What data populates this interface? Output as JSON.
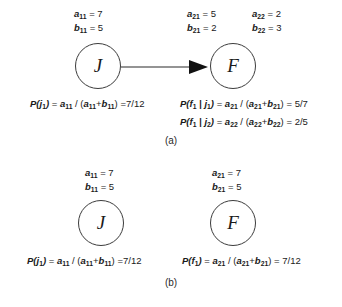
{
  "figure": {
    "background": "#ffffff",
    "stroke_color": "#3c3c3c",
    "text_color": "#1a1a1a"
  },
  "panels": [
    {
      "id": "a",
      "caption": "(a)",
      "has_edge": true,
      "edge": {
        "from": "J",
        "to": "F",
        "style": "solid-arrow"
      },
      "nodes": [
        {
          "id": "J",
          "label": "J",
          "params": [
            {
              "name": "a",
              "sub": "11",
              "eq": "=",
              "value": "7"
            },
            {
              "name": "b",
              "sub": "11",
              "eq": "=",
              "value": "5"
            }
          ]
        },
        {
          "id": "F",
          "label": "F",
          "params": [
            {
              "name": "a",
              "sub": "21",
              "eq": "=",
              "value": "5"
            },
            {
              "name": "b",
              "sub": "21",
              "eq": "=",
              "value": "2"
            },
            {
              "name": "a",
              "sub": "22",
              "eq": "=",
              "value": "2"
            },
            {
              "name": "b",
              "sub": "22",
              "eq": "=",
              "value": "3"
            }
          ]
        }
      ],
      "equations": [
        {
          "id": "pj1",
          "lhs_fn": "P",
          "lhs_arg": "j",
          "lhs_sub": "1",
          "numerator": "a",
          "numerator_sub": "11",
          "denom_left": "a",
          "denom_left_sub": "11",
          "denom_right": "b",
          "denom_right_sub": "11",
          "result": "7/12"
        },
        {
          "id": "pf1_j1",
          "lhs_fn": "P",
          "lhs_arg": "f",
          "lhs_sub": "1",
          "cond_arg": "j",
          "cond_sub": "1",
          "numerator": "a",
          "numerator_sub": "21",
          "denom_left": "a",
          "denom_left_sub": "21",
          "denom_right": "b",
          "denom_right_sub": "21",
          "result": "5/7"
        },
        {
          "id": "pf1_j2",
          "lhs_fn": "P",
          "lhs_arg": "f",
          "lhs_sub": "1",
          "cond_arg": "j",
          "cond_sub": "2",
          "numerator": "a",
          "numerator_sub": "22",
          "denom_left": "a",
          "denom_left_sub": "22",
          "denom_right": "b",
          "denom_right_sub": "22",
          "result": "2/5"
        }
      ]
    },
    {
      "id": "b",
      "caption": "(b)",
      "has_edge": false,
      "nodes": [
        {
          "id": "J",
          "label": "J",
          "params": [
            {
              "name": "a",
              "sub": "11",
              "eq": "=",
              "value": "7"
            },
            {
              "name": "b",
              "sub": "11",
              "eq": "=",
              "value": "5"
            }
          ]
        },
        {
          "id": "F",
          "label": "F",
          "params": [
            {
              "name": "a",
              "sub": "21",
              "eq": "=",
              "value": "7"
            },
            {
              "name": "b",
              "sub": "21",
              "eq": "=",
              "value": "5"
            }
          ]
        }
      ],
      "equations": [
        {
          "id": "pj1",
          "lhs_fn": "P",
          "lhs_arg": "j",
          "lhs_sub": "1",
          "numerator": "a",
          "numerator_sub": "11",
          "denom_left": "a",
          "denom_left_sub": "11",
          "denom_right": "b",
          "denom_right_sub": "11",
          "result": "7/12"
        },
        {
          "id": "pf1",
          "lhs_fn": "P",
          "lhs_arg": "f",
          "lhs_sub": "1",
          "numerator": "a",
          "numerator_sub": "21",
          "denom_left": "a",
          "denom_left_sub": "21",
          "denom_right": "b",
          "denom_right_sub": "21",
          "result": "7/12"
        }
      ]
    }
  ],
  "symbols": {
    "equals": "=",
    "slash": "/",
    "plus": "+",
    "bar": "|",
    "lparen": "(",
    "rparen": ")"
  }
}
